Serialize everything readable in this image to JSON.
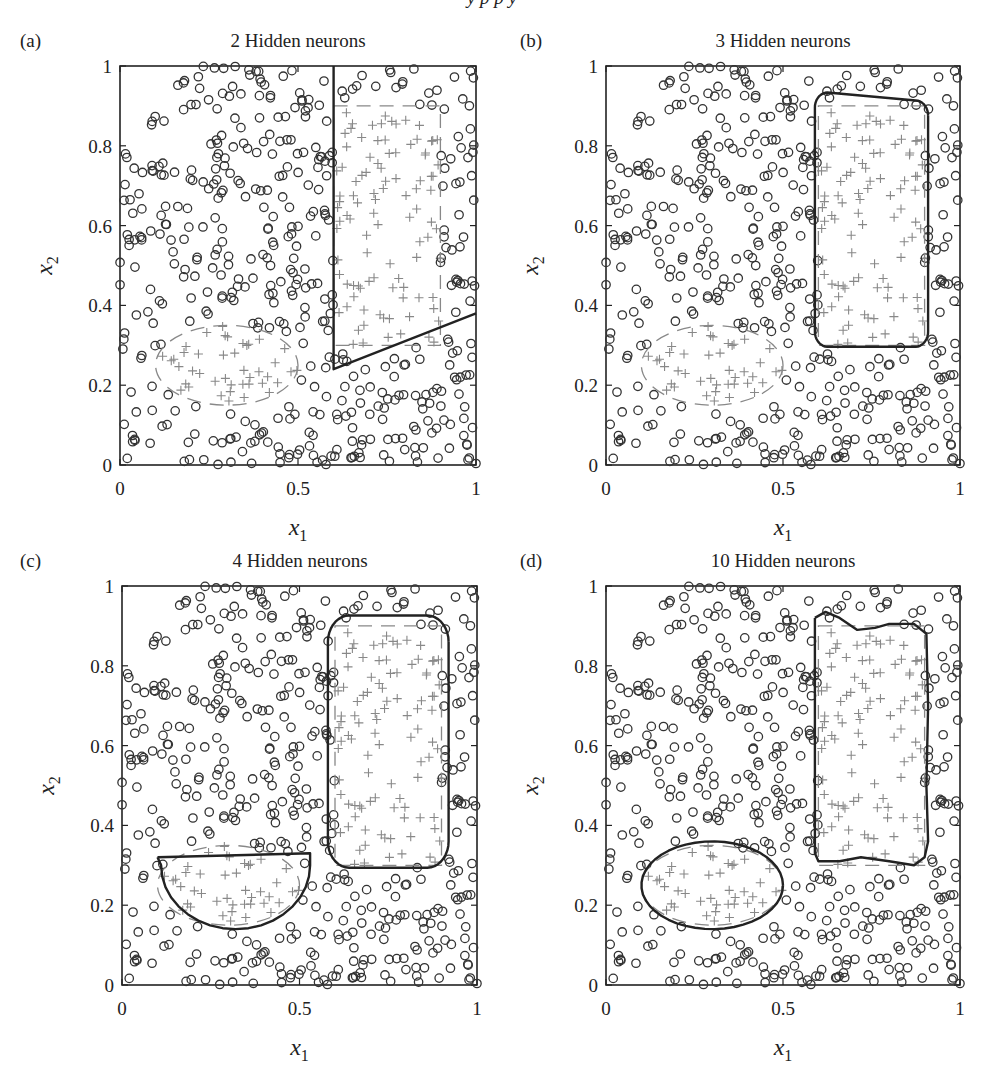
{
  "page": {
    "header_fragment": "y p p     y"
  },
  "chart_data": [
    {
      "type": "scatter",
      "panel": "(a)",
      "title": "2 Hidden neurons",
      "xlabel": "x1",
      "ylabel": "x2",
      "xlim": [
        0,
        1
      ],
      "ylim": [
        0,
        1
      ],
      "xticks": [
        "0",
        "0.5",
        "1"
      ],
      "yticks": [
        "0",
        "0.2",
        "0.4",
        "0.6",
        "0.8",
        "1"
      ],
      "grid": false,
      "series": [
        {
          "name": "class 0",
          "marker": "circle",
          "color": "#333333",
          "count_approx": 450
        },
        {
          "name": "class 1",
          "marker": "plus",
          "color": "#888888",
          "count_approx": 120
        }
      ],
      "target_regions": [
        {
          "shape": "rectangle",
          "style": "dashed",
          "x1": [
            0.6,
            0.9
          ],
          "x2": [
            0.3,
            0.9
          ]
        },
        {
          "shape": "ellipse",
          "style": "dashed",
          "center": [
            0.3,
            0.25
          ],
          "radii": [
            0.2,
            0.1
          ]
        }
      ],
      "decision_boundary": {
        "style": "solid",
        "description": "vertical line at x1=0.6 from x2=1 down to 0.24, then straight line to (1, 0.38)",
        "points": [
          [
            0.6,
            1.0
          ],
          [
            0.6,
            0.24
          ],
          [
            1.0,
            0.38
          ]
        ]
      }
    },
    {
      "type": "scatter",
      "panel": "(b)",
      "title": "3 Hidden neurons",
      "xlabel": "x1",
      "ylabel": "x2",
      "xlim": [
        0,
        1
      ],
      "ylim": [
        0,
        1
      ],
      "xticks": [
        "0",
        "0.5",
        "1"
      ],
      "yticks": [
        "0",
        "0.2",
        "0.4",
        "0.6",
        "0.8",
        "1"
      ],
      "grid": false,
      "target_regions": [
        {
          "shape": "rectangle",
          "style": "dashed",
          "x1": [
            0.6,
            0.9
          ],
          "x2": [
            0.3,
            0.9
          ]
        },
        {
          "shape": "ellipse",
          "style": "dashed",
          "center": [
            0.3,
            0.25
          ],
          "radii": [
            0.2,
            0.1
          ]
        }
      ],
      "decision_boundary": {
        "style": "solid",
        "description": "rounded rectangle around the right target region; ellipse not captured",
        "bounds": {
          "x1": [
            0.59,
            0.91
          ],
          "x2": [
            0.3,
            0.93
          ]
        }
      }
    },
    {
      "type": "scatter",
      "panel": "(c)",
      "title": "4 Hidden neurons",
      "xlabel": "x1",
      "ylabel": "x2",
      "xlim": [
        0,
        1
      ],
      "ylim": [
        0,
        1
      ],
      "xticks": [
        "0",
        "0.5",
        "1"
      ],
      "yticks": [
        "0",
        "0.2",
        "0.4",
        "0.6",
        "0.8",
        "1"
      ],
      "grid": false,
      "target_regions": [
        {
          "shape": "rectangle",
          "style": "dashed",
          "x1": [
            0.6,
            0.9
          ],
          "x2": [
            0.3,
            0.9
          ]
        },
        {
          "shape": "ellipse",
          "style": "dashed",
          "center": [
            0.3,
            0.25
          ],
          "radii": [
            0.2,
            0.1
          ]
        }
      ],
      "decision_boundary": {
        "style": "solid",
        "description": "rounded rectangle around right region plus half-ellipse (flat top at x2~0.33) around lower-left region",
        "bounds": [
          {
            "x1": [
              0.58,
              0.92
            ],
            "x2": [
              0.3,
              0.92
            ]
          },
          {
            "x1": [
              0.1,
              0.53
            ],
            "x2": [
              0.14,
              0.33
            ]
          }
        ]
      }
    },
    {
      "type": "scatter",
      "panel": "(d)",
      "title": "10 Hidden neurons",
      "xlabel": "x1",
      "ylabel": "x2",
      "xlim": [
        0,
        1
      ],
      "ylim": [
        0,
        1
      ],
      "xticks": [
        "0",
        "0.5",
        "1"
      ],
      "yticks": [
        "0",
        "0.2",
        "0.4",
        "0.6",
        "0.8",
        "1"
      ],
      "grid": false,
      "target_regions": [
        {
          "shape": "rectangle",
          "style": "dashed",
          "x1": [
            0.6,
            0.9
          ],
          "x2": [
            0.3,
            0.9
          ]
        },
        {
          "shape": "ellipse",
          "style": "dashed",
          "center": [
            0.3,
            0.25
          ],
          "radii": [
            0.2,
            0.1
          ]
        }
      ],
      "decision_boundary": {
        "style": "solid",
        "description": "wavy rectangle around right region (notched top/bottom) plus full ellipse around lower-left region",
        "bounds": [
          {
            "x1": [
              0.59,
              0.91
            ],
            "x2": [
              0.31,
              0.93
            ]
          },
          {
            "x1": [
              0.1,
              0.5
            ],
            "x2": [
              0.14,
              0.36
            ]
          }
        ]
      }
    }
  ]
}
